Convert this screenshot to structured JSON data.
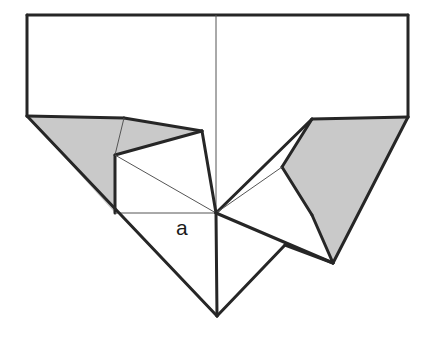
{
  "figure": {
    "background_color": "#ffffff",
    "stroke_color": "#262626",
    "thin_stroke_color": "#555555",
    "shade_color": "#c9c9c9",
    "shade_edge_color": "#262626",
    "labels": [
      {
        "name": "angle-label-a",
        "text": "a",
        "x": 176,
        "y": 235
      }
    ],
    "points": {
      "top_left": [
        27,
        15
      ],
      "top_right": [
        408,
        15
      ],
      "left_edge_bottom": [
        27,
        116
      ],
      "right_edge_bottom": [
        408,
        117
      ],
      "left_crease_top": [
        124,
        118
      ],
      "left_flap_peak": [
        202,
        131
      ],
      "left_quad_upper": [
        115,
        155
      ],
      "left_quad_lower": [
        115,
        213
      ],
      "center": [
        216,
        213
      ],
      "bottom_apex": [
        217,
        316
      ],
      "right_shade_top_left": [
        312,
        119
      ],
      "right_shade_left": [
        282,
        167
      ],
      "right_shade_bottom": [
        312,
        215
      ],
      "right_crease_vertex": [
        285,
        245
      ],
      "right_spike": [
        333,
        263
      ]
    },
    "shapes": [
      {
        "name": "left-shaded-flap",
        "fill": "shade",
        "points": "27,116 124,118 202,131 115,155 115,213"
      },
      {
        "name": "right-shaded-flap",
        "fill": "shade",
        "points": "312,119 408,117 333,263 312,215 282,167"
      },
      {
        "name": "left-white-quad",
        "fill": "white",
        "points": "115,155 202,131 216,213 115,213"
      }
    ],
    "edges": [
      {
        "name": "sheet-top-edge",
        "weight": "thick",
        "from": [
          27,
          15
        ],
        "to": [
          408,
          15
        ]
      },
      {
        "name": "sheet-left-edge",
        "weight": "thick",
        "from": [
          27,
          15
        ],
        "to": [
          27,
          116
        ]
      },
      {
        "name": "sheet-right-edge",
        "weight": "thick",
        "from": [
          408,
          15
        ],
        "to": [
          408,
          117
        ]
      },
      {
        "name": "center-vertical-crease",
        "weight": "thin",
        "from": [
          216,
          15
        ],
        "to": [
          216,
          213
        ]
      },
      {
        "name": "left-shade-top-edge",
        "weight": "thick",
        "from": [
          27,
          116
        ],
        "to": [
          124,
          118
        ]
      },
      {
        "name": "left-shade-upper-edge",
        "weight": "thick",
        "from": [
          124,
          118
        ],
        "to": [
          202,
          131
        ]
      },
      {
        "name": "left-shade-fold-edge",
        "weight": "thick",
        "from": [
          202,
          131
        ],
        "to": [
          115,
          155
        ]
      },
      {
        "name": "left-inner-crease",
        "weight": "thin",
        "from": [
          124,
          118
        ],
        "to": [
          115,
          155
        ]
      },
      {
        "name": "left-quad-left-edge",
        "weight": "thick",
        "from": [
          115,
          155
        ],
        "to": [
          115,
          213
        ]
      },
      {
        "name": "left-quad-diagonal",
        "weight": "thin",
        "from": [
          115,
          155
        ],
        "to": [
          216,
          213
        ]
      },
      {
        "name": "left-quad-bottom-edge",
        "weight": "thin",
        "from": [
          115,
          213
        ],
        "to": [
          216,
          213
        ]
      },
      {
        "name": "left-flap-peak-to-center",
        "weight": "thick",
        "from": [
          202,
          131
        ],
        "to": [
          216,
          213
        ]
      },
      {
        "name": "left-outer-fold-diagonal",
        "weight": "thick",
        "from": [
          27,
          116
        ],
        "to": [
          217,
          316
        ]
      },
      {
        "name": "bottom-right-edge",
        "weight": "thick",
        "from": [
          217,
          316
        ],
        "to": [
          285,
          245
        ]
      },
      {
        "name": "center-to-bottom-apex",
        "weight": "thick",
        "from": [
          216,
          213
        ],
        "to": [
          217,
          316
        ]
      },
      {
        "name": "right-shade-top-edge",
        "weight": "thick",
        "from": [
          312,
          119
        ],
        "to": [
          408,
          117
        ]
      },
      {
        "name": "right-shade-outer-diagonal",
        "weight": "thick",
        "from": [
          408,
          117
        ],
        "to": [
          333,
          263
        ]
      },
      {
        "name": "right-shade-upper-left-edge",
        "weight": "thick",
        "from": [
          312,
          119
        ],
        "to": [
          282,
          167
        ]
      },
      {
        "name": "right-shade-lower-left-edge",
        "weight": "thick",
        "from": [
          282,
          167
        ],
        "to": [
          312,
          215
        ]
      },
      {
        "name": "right-shade-spike-edge",
        "weight": "thick",
        "from": [
          312,
          215
        ],
        "to": [
          333,
          263
        ]
      },
      {
        "name": "center-to-right-shade-top",
        "weight": "thick",
        "from": [
          216,
          213
        ],
        "to": [
          312,
          119
        ]
      },
      {
        "name": "center-to-right-shade-left",
        "weight": "thin",
        "from": [
          216,
          213
        ],
        "to": [
          282,
          167
        ]
      },
      {
        "name": "center-to-right-spike",
        "weight": "thick",
        "from": [
          216,
          213
        ],
        "to": [
          333,
          263
        ]
      },
      {
        "name": "right-crease-to-spike",
        "weight": "thick",
        "from": [
          285,
          245
        ],
        "to": [
          333,
          263
        ]
      }
    ]
  }
}
